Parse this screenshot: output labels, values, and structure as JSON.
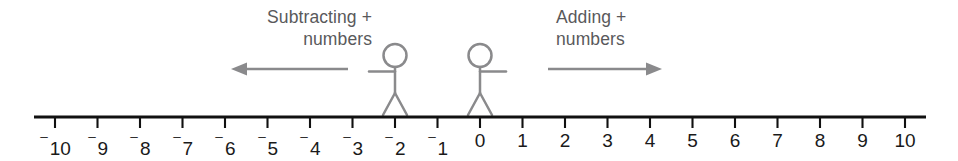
{
  "canvas": {
    "width": 958,
    "height": 161,
    "background": "#ffffff"
  },
  "colors": {
    "axis": "#111111",
    "tick_label": "#1a1a1a",
    "caption": "#59595b",
    "figure_stroke": "#8a8a8c",
    "arrow": "#8a8a8c"
  },
  "captions": {
    "left": {
      "text": "Subtracting +\nnumbers",
      "align": "right"
    },
    "right": {
      "text": "Adding +\nnumbers",
      "align": "left"
    }
  },
  "arrows": {
    "left": {
      "direction": "left",
      "from_x": 348,
      "to_x": 232,
      "y": 69
    },
    "right": {
      "direction": "right",
      "from_x": 548,
      "to_x": 661,
      "y": 69
    }
  },
  "stick_figures": [
    {
      "name": "figure-subtracting",
      "stands_at_value": -2,
      "arm_direction": "left",
      "center_x": 395
    },
    {
      "name": "figure-adding",
      "stands_at_value": 0,
      "arm_direction": "right",
      "center_x": 480
    }
  ],
  "number_line": {
    "axis_y": 117,
    "line_start_x": 34,
    "line_end_x": 926,
    "first_tick_x": 55,
    "tick_spacing": 42.5,
    "tick_height": 11,
    "label_y": 131,
    "min": -10,
    "max": 10,
    "ticks": [
      {
        "value": -10,
        "sign": "⁻",
        "digits": "10"
      },
      {
        "value": -9,
        "sign": "⁻",
        "digits": "9"
      },
      {
        "value": -8,
        "sign": "⁻",
        "digits": "8"
      },
      {
        "value": -7,
        "sign": "⁻",
        "digits": "7"
      },
      {
        "value": -6,
        "sign": "⁻",
        "digits": "6"
      },
      {
        "value": -5,
        "sign": "⁻",
        "digits": "5"
      },
      {
        "value": -4,
        "sign": "⁻",
        "digits": "4"
      },
      {
        "value": -3,
        "sign": "⁻",
        "digits": "3"
      },
      {
        "value": -2,
        "sign": "⁻",
        "digits": "2"
      },
      {
        "value": -1,
        "sign": "⁻",
        "digits": "1"
      },
      {
        "value": 0,
        "sign": "",
        "digits": "0"
      },
      {
        "value": 1,
        "sign": "",
        "digits": "1"
      },
      {
        "value": 2,
        "sign": "",
        "digits": "2"
      },
      {
        "value": 3,
        "sign": "",
        "digits": "3"
      },
      {
        "value": 4,
        "sign": "",
        "digits": "4"
      },
      {
        "value": 5,
        "sign": "",
        "digits": "5"
      },
      {
        "value": 6,
        "sign": "",
        "digits": "6"
      },
      {
        "value": 7,
        "sign": "",
        "digits": "7"
      },
      {
        "value": 8,
        "sign": "",
        "digits": "8"
      },
      {
        "value": 9,
        "sign": "",
        "digits": "9"
      },
      {
        "value": 10,
        "sign": "",
        "digits": "10"
      }
    ]
  }
}
